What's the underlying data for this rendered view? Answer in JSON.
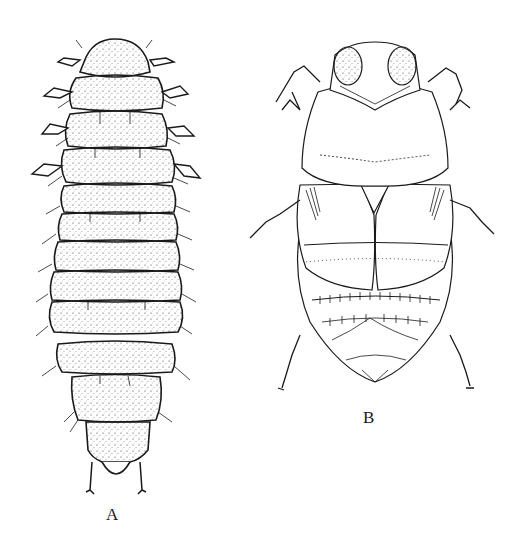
{
  "figure": {
    "panels": [
      {
        "label": "A",
        "subject": "larva",
        "view": "dorsal"
      },
      {
        "label": "B",
        "subject": "adult beetle",
        "view": "dorsal"
      }
    ],
    "colors": {
      "ink": "#1a1a1a",
      "background": "#ffffff"
    }
  }
}
